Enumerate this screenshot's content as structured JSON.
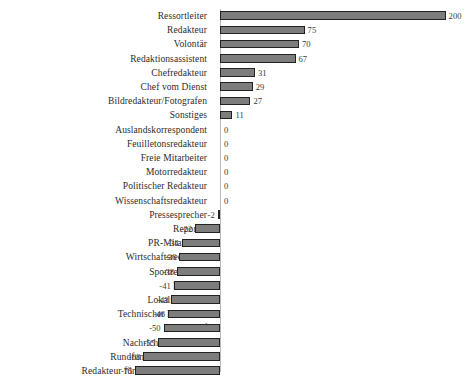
{
  "chart_data": {
    "type": "bar",
    "orientation": "horizontal",
    "title": "",
    "xlabel": "",
    "ylabel": "",
    "xlim": [
      -75,
      200
    ],
    "grid": false,
    "legend": false,
    "zero_line": true,
    "bar_color": "#7d7d7d",
    "bar_edge_color": "#222222",
    "axis_color": "#b9b9bd",
    "categories": [
      "Ressortleiter",
      "Redakteur",
      "Volontär",
      "Redaktionsassistent",
      "Chefredakteur",
      "Chef vom Dienst",
      "Bildredakteur/Fotografen",
      "Sonstiges",
      "Auslandskorrespondent",
      "Feuilletonsredakteur",
      "Freie Mitarbeiter",
      "Motorredakteur",
      "Politischer Redakteur",
      "Wissenschaftsredakteur",
      "Pressesprecher",
      "Reporter",
      "PR-Mitarbeiter",
      "Wirtschaftsredakteur",
      "Sportredakteur",
      "PR-Chef",
      "Lokalredakteur",
      "Technischer Redakteur",
      "Lokalchef",
      "Nachrichtenredakteur",
      "Rundfunk/TV-Redakteur",
      "Redakteur für PR-Publikationen"
    ],
    "values": [
      200,
      75,
      70,
      67,
      31,
      29,
      27,
      11,
      0,
      0,
      0,
      0,
      0,
      0,
      -2,
      -22,
      -34,
      -36,
      -38,
      -41,
      -43,
      -46,
      -50,
      -55,
      -68,
      -75
    ],
    "value_labels": [
      "200",
      "75",
      "70",
      "67",
      "31",
      "29",
      "27",
      "11",
      "0",
      "0",
      "0",
      "0",
      "0",
      "0",
      "-2",
      "-22",
      "-34",
      "-36",
      "-38",
      "-41",
      "-43",
      "-46",
      "-50",
      "-55",
      "-68",
      "-75"
    ]
  }
}
